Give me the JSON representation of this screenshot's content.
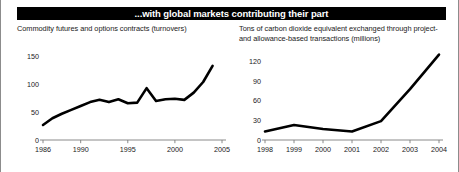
{
  "banner": {
    "title": "...with global markets contributing their part"
  },
  "panels": [
    {
      "caption": "Commodity futures and options contracts (turnovers)",
      "name": "commodity-futures-chart"
    },
    {
      "caption": "Tons of carbon dioxide equivalent exchanged through project- and allowance-based transactions (millions)",
      "name": "carbon-dioxide-chart"
    }
  ],
  "chart_data": [
    {
      "type": "line",
      "title": "Commodity futures and options contracts (turnovers)",
      "xlabel": "",
      "ylabel": "",
      "xlim": [
        1986,
        2005
      ],
      "ylim": [
        0,
        165
      ],
      "grid": false,
      "legend": "none",
      "yticks": [
        0,
        50,
        100,
        150
      ],
      "ytick_labels": [
        "0",
        "50",
        "100",
        "150"
      ],
      "xticks": [
        1986,
        1990,
        1995,
        2000,
        2005
      ],
      "xtick_labels": [
        "1986",
        "1990",
        "1995",
        "2000",
        "2005"
      ],
      "x": [
        1986,
        1987,
        1988,
        1989,
        1990,
        1991,
        1992,
        1993,
        1994,
        1995,
        1996,
        1997,
        1998,
        1999,
        2000,
        2001,
        2002,
        2003,
        2004
      ],
      "values": [
        27,
        39,
        47,
        54,
        61,
        68,
        72,
        68,
        73,
        66,
        67,
        93,
        70,
        73,
        74,
        72,
        85,
        104,
        133
      ]
    },
    {
      "type": "line",
      "title": "Tons of carbon dioxide equivalent exchanged through project- and allowance-based transactions (millions)",
      "xlabel": "",
      "ylabel": "",
      "xlim": [
        1998,
        2004
      ],
      "ylim": [
        0,
        135
      ],
      "grid": false,
      "legend": "none",
      "yticks": [
        0,
        30,
        60,
        90,
        120
      ],
      "ytick_labels": [
        "0",
        "30",
        "60",
        "90",
        "120"
      ],
      "xticks": [
        1998,
        1999,
        2000,
        2001,
        2002,
        2003,
        2004
      ],
      "xtick_labels": [
        "1998",
        "1999",
        "2000",
        "2001",
        "2002",
        "2003",
        "2004"
      ],
      "x": [
        1998,
        1999,
        2000,
        2001,
        2002,
        2003,
        2004
      ],
      "values": [
        13,
        23,
        17,
        13,
        29,
        78,
        131
      ]
    }
  ]
}
